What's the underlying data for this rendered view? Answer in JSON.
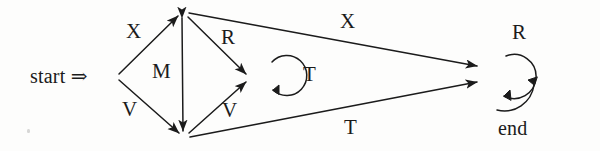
{
  "diagram": {
    "background_color": "#fdfdfc",
    "stroke_color": "#1b1b1b",
    "start_label": "start ⇒",
    "end_label": "end",
    "nodes": [
      {
        "id": "q_start",
        "name": "start-vertex",
        "x": 118,
        "y": 77
      },
      {
        "id": "q_top",
        "name": "top-vertex",
        "x": 182,
        "y": 12
      },
      {
        "id": "q_bottom",
        "name": "bottom-vertex",
        "x": 183,
        "y": 137
      },
      {
        "id": "q_mid",
        "name": "middle-vertex",
        "x": 250,
        "y": 78
      },
      {
        "id": "q_end",
        "name": "end-vertex",
        "x": 487,
        "y": 75
      }
    ],
    "edge_labels": [
      {
        "id": "x-left",
        "text": "X",
        "x": 126,
        "y": 21
      },
      {
        "id": "v-left",
        "text": "V",
        "x": 122,
        "y": 99
      },
      {
        "id": "m-mid",
        "text": "M",
        "x": 152,
        "y": 61
      },
      {
        "id": "r-top",
        "text": "R",
        "x": 221,
        "y": 27
      },
      {
        "id": "v-mid",
        "text": "V",
        "x": 222,
        "y": 100
      },
      {
        "id": "t-loop",
        "text": "T",
        "x": 303,
        "y": 64
      },
      {
        "id": "x-top",
        "text": "X",
        "x": 340,
        "y": 11
      },
      {
        "id": "t-bottom",
        "text": "T",
        "x": 344,
        "y": 117
      },
      {
        "id": "r-end",
        "text": "R",
        "x": 512,
        "y": 22
      }
    ],
    "transitions": [
      {
        "from": "q_start",
        "to": "q_top",
        "symbol": "X"
      },
      {
        "from": "q_start",
        "to": "q_bottom",
        "symbol": "V"
      },
      {
        "from": "q_top",
        "to": "q_bottom",
        "symbol": "M",
        "bidirectional": true
      },
      {
        "from": "q_top",
        "to": "q_mid",
        "symbol": "R"
      },
      {
        "from": "q_bottom",
        "to": "q_mid",
        "symbol": "V"
      },
      {
        "from": "q_mid",
        "to": "q_mid",
        "symbol": "T",
        "self_loop": true
      },
      {
        "from": "q_top",
        "to": "q_end",
        "symbol": "X"
      },
      {
        "from": "q_bottom",
        "to": "q_end",
        "symbol": "T"
      },
      {
        "from": "q_end",
        "to": "q_end",
        "symbol": "R",
        "self_loop": true
      }
    ]
  }
}
